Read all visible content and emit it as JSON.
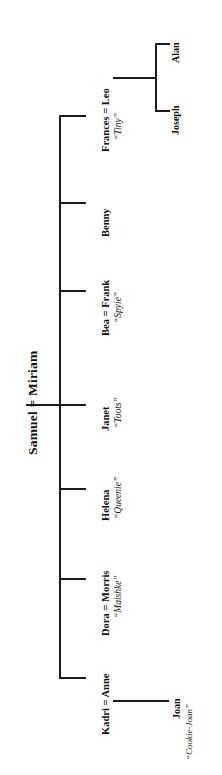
{
  "diagram": {
    "type": "family-tree",
    "orientation": "rotated-90-ccw",
    "root": {
      "label": "Samuel = Miriam",
      "spouse_a": "Samuel",
      "spouse_b": "Miriam",
      "union_symbol": "="
    },
    "children": [
      {
        "id": "frances",
        "label": "Frances = Leo",
        "name": "Frances",
        "spouse": "Leo",
        "nickname": "“Tiny”",
        "children": [
          {
            "id": "joseph",
            "label": "Joseph"
          },
          {
            "id": "alan",
            "label": "Alan"
          }
        ]
      },
      {
        "id": "benny",
        "label": "Benny",
        "name": "Benny",
        "nickname": "",
        "children": []
      },
      {
        "id": "frank",
        "label": "Bea = Frank",
        "name": "Frank",
        "spouse": "Bea",
        "nickname": "“Spyie”",
        "children": []
      },
      {
        "id": "janet",
        "label": "Janet",
        "name": "Janet",
        "nickname": "“Toots”",
        "children": []
      },
      {
        "id": "helena",
        "label": "Helena",
        "name": "Helena",
        "nickname": "“Queenie”",
        "children": []
      },
      {
        "id": "morris",
        "label": "Dora = Morris",
        "name": "Morris",
        "spouse": "Dora",
        "nickname": "“Maishke”",
        "children": []
      },
      {
        "id": "anne",
        "label": "Kadri = Anne",
        "name": "Anne",
        "spouse": "Kadri",
        "nickname": "",
        "children": [
          {
            "id": "joan",
            "label": "Joan",
            "nickname": "“Cookie-Joan”"
          }
        ]
      }
    ],
    "colors": {
      "ink": "#111111",
      "line": "#1a1a1a",
      "background": "#ffffff"
    }
  },
  "labels": {
    "title": "Samuel = Miriam",
    "frances": "Frances = Leo",
    "frances_nick": "“Tiny”",
    "joseph": "Joseph",
    "alan": "Alan",
    "benny": "Benny",
    "frank": "Bea = Frank",
    "frank_nick": "“Spyie”",
    "janet": "Janet",
    "janet_nick": "“Toots”",
    "helena": "Helena",
    "helena_nick": "“Queenie”",
    "morris": "Dora = Morris",
    "morris_nick": "“Maishke”",
    "anne": "Kadri = Anne",
    "joan": "Joan",
    "joan_nick": "“Cookie-Joan”"
  }
}
